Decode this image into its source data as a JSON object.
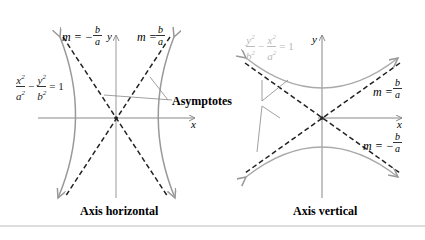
{
  "figure": {
    "left": {
      "caption": "Axis horizontal",
      "equation": {
        "num1": "x",
        "den1": "a",
        "num2": "y",
        "den2": "b",
        "exp": "2",
        "rhs": "= 1",
        "minus": "−"
      },
      "slope_neg": {
        "m": "m = −",
        "num": "b",
        "den": "a"
      },
      "slope_pos": {
        "m": "m =",
        "num": "b",
        "den": "a"
      },
      "y_axis": "y",
      "x_axis": "x"
    },
    "right": {
      "caption": "Axis vertical",
      "equation": {
        "num1": "y",
        "den1": "b",
        "num2": "x",
        "den2": "a",
        "exp": "2",
        "rhs": "= 1",
        "minus": "−"
      },
      "slope_pos": {
        "m": "m =",
        "num": "b",
        "den": "a"
      },
      "slope_neg": {
        "m": "m = −",
        "num": "b",
        "den": "a"
      },
      "y_axis": "y",
      "x_axis": "x"
    },
    "asymptotes_label": "Asymptotes",
    "colors": {
      "curve": "#a0a0a0",
      "asymptote": "#222222",
      "axis": "#888888",
      "faded_text": "#b8b8b8"
    }
  }
}
